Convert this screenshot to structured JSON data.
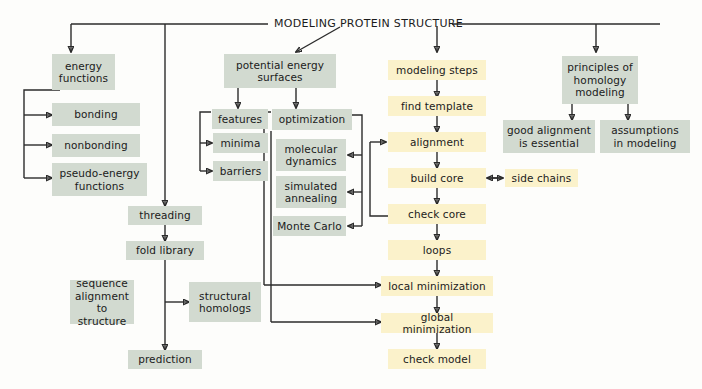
{
  "diagram": {
    "title": "MODELING PROTEIN STRUCTURE",
    "colors": {
      "gray_box": "#d2dad0",
      "yellow_box": "#fbf2cb",
      "line": "#2b2b2b",
      "background": "#fdfdfb"
    },
    "branches": {
      "energy_functions": {
        "root": "energy\nfunctions",
        "children": [
          "bonding",
          "nonbonding",
          "pseudo-energy\nfunctions"
        ]
      },
      "threading": {
        "root": "threading",
        "chain": [
          "fold library",
          "prediction"
        ],
        "side_left": "sequence\nalignment\nto structure",
        "side_right": "structural\nhomologs"
      },
      "potential_energy_surfaces": {
        "root": "potential energy\nsurfaces",
        "features": {
          "root": "features",
          "children": [
            "minima",
            "barriers"
          ]
        },
        "optimization": {
          "root": "optimization",
          "children": [
            "molecular\ndynamics",
            "simulated\nannealing",
            "Monte Carlo"
          ]
        }
      },
      "modeling_steps": {
        "root": "modeling steps",
        "chain": [
          "find template",
          "alignment",
          "build core",
          "check core",
          "loops",
          "local minimization",
          "global minimization",
          "check model"
        ],
        "side_of_build_core": "side chains"
      },
      "principles_of_homology_modeling": {
        "root": "principles of\nhomology\nmodeling",
        "children": [
          "good alignment\nis essential",
          "assumptions\nin modeling"
        ]
      }
    }
  }
}
